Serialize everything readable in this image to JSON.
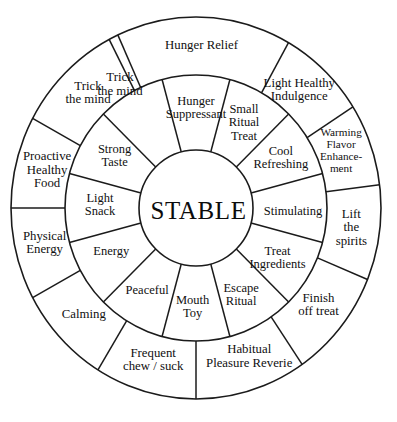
{
  "diagram": {
    "type": "concentric-wheel",
    "title": "STABLE",
    "hub": {
      "label": "STABLE"
    },
    "geometry": {
      "center_x": 196,
      "center_y": 208,
      "hub_radius": 57,
      "inner_ring_outer_radius": 131,
      "outer_ring_outer_radius": 186,
      "inner_segment_count": 12,
      "outer_segment_count": 12,
      "stroke_color": "#1b1b1b",
      "background_color": "#ffffff",
      "text_color": "#101010"
    },
    "inner_ring": [
      {
        "label": "Hunger\nSuppressant",
        "start_deg": -105,
        "end_deg": -75,
        "label_deg": -90,
        "label_radius": 99
      },
      {
        "label": "Small\nRitual\nTreat",
        "start_deg": -75,
        "end_deg": -45,
        "label_deg": -60,
        "label_radius": 97
      },
      {
        "label": "Cool\nRefreshing",
        "start_deg": -45,
        "end_deg": -15,
        "label_deg": -30,
        "label_radius": 99
      },
      {
        "label": "Stimulating",
        "start_deg": -15,
        "end_deg": 15,
        "label_deg": 2,
        "label_radius": 98
      },
      {
        "label": "Treat\nIngredients",
        "start_deg": 15,
        "end_deg": 45,
        "label_deg": 31,
        "label_radius": 96
      },
      {
        "label": "Escape\nRitual",
        "start_deg": 45,
        "end_deg": 75,
        "label_deg": 62,
        "label_radius": 97
      },
      {
        "label": "Mouth\nToy",
        "start_deg": 75,
        "end_deg": 105,
        "label_deg": 92,
        "label_radius": 98
      },
      {
        "label": "Peaceful",
        "start_deg": 105,
        "end_deg": 135,
        "label_deg": 121,
        "label_radius": 96
      },
      {
        "label": "Energy",
        "start_deg": 135,
        "end_deg": 165,
        "label_deg": 153,
        "label_radius": 96
      },
      {
        "label": "Light\nSnack",
        "start_deg": 165,
        "end_deg": 195,
        "label_deg": 182,
        "label_radius": 97
      },
      {
        "label": "Strong\nTaste",
        "start_deg": 195,
        "end_deg": 225,
        "label_deg": 212,
        "label_radius": 97
      },
      {
        "label": "Trick\nthe mind",
        "start_deg": 225,
        "end_deg": 255,
        "label_deg": 240,
        "label_radius": 0
      }
    ],
    "outer_ring": [
      {
        "label": "Hunger Relief",
        "start_deg": -115,
        "end_deg": -60,
        "label_deg": -88,
        "label_radius": 160
      },
      {
        "label": "Light Healthy\nIndulgence",
        "start_deg": -60,
        "end_deg": -32,
        "label_deg": -48,
        "label_radius": 156
      },
      {
        "label": "Warming\nFlavor\nEnhance-\nment",
        "start_deg": -32,
        "end_deg": -7,
        "label_deg": -21,
        "label_radius": 157
      },
      {
        "label": "Lift\nthe\nspirits",
        "start_deg": -7,
        "end_deg": 22,
        "label_deg": 7,
        "label_radius": 158
      },
      {
        "label": "Finish\noff treat",
        "start_deg": 22,
        "end_deg": 55,
        "label_deg": 38,
        "label_radius": 157
      },
      {
        "label": "Habitual\nPleasure Reverie",
        "start_deg": 55,
        "end_deg": 90,
        "label_deg": 70,
        "label_radius": 157
      },
      {
        "label": "Frequent\nchew / suck",
        "start_deg": 90,
        "end_deg": 122,
        "label_deg": 106,
        "label_radius": 157
      },
      {
        "label": "Calming",
        "start_deg": 122,
        "end_deg": 152,
        "label_deg": 137,
        "label_radius": 155
      },
      {
        "label": "Physical\nEnergy",
        "start_deg": 152,
        "end_deg": 180,
        "label_deg": 167,
        "label_radius": 157
      },
      {
        "label": "Proactive\nHealthy\nFood",
        "start_deg": 180,
        "end_deg": 208,
        "label_deg": 194,
        "label_radius": 155
      },
      {
        "label": "Trick\nthe mind",
        "start_deg": 208,
        "end_deg": 242,
        "label_deg": 226,
        "label_radius": 157
      }
    ],
    "inner_spoke_angles_deg": [
      -105,
      -75,
      -45,
      -15,
      15,
      45,
      75,
      105,
      135,
      165,
      195,
      225
    ],
    "outer_spoke_angles_deg": [
      -115,
      -60,
      -32,
      -7,
      22,
      55,
      90,
      122,
      152,
      180,
      208,
      242
    ]
  }
}
